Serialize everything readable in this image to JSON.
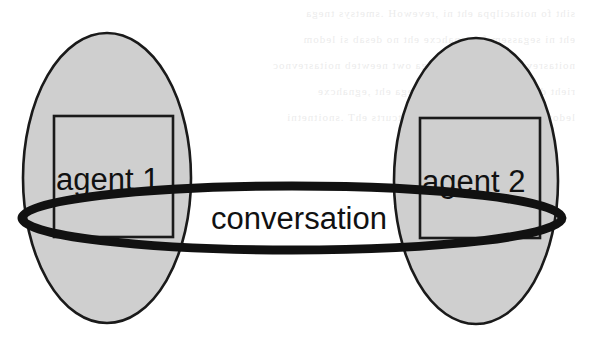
{
  "figure": {
    "kind": "venn-style agent conversation diagram",
    "background_color": "#ffffff",
    "ink_color": "#111111",
    "agent_fill_color": "#cfcfcf",
    "nodes": [
      {
        "id": "agent-1",
        "label": "agent 1",
        "shape": "ellipse",
        "inner_shape": "square",
        "cx": 107,
        "cy": 178,
        "rx": 84,
        "ry": 145,
        "square": {
          "x": 54,
          "y": 116,
          "w": 119,
          "h": 121
        },
        "label_x": 56,
        "label_y": 190
      },
      {
        "id": "agent-2",
        "label": "agent 2",
        "shape": "ellipse",
        "inner_shape": "square",
        "cx": 476,
        "cy": 181,
        "rx": 82,
        "ry": 143,
        "square": {
          "x": 420,
          "y": 118,
          "w": 120,
          "h": 120
        },
        "label_x": 422,
        "label_y": 192
      }
    ],
    "link": {
      "id": "conversation",
      "label": "conversation",
      "shape": "ellipse",
      "cx": 292,
      "cy": 218,
      "rx": 270,
      "ry": 32,
      "stroke_width": 9,
      "label_x": 299,
      "label_y": 229
    },
    "page_bleed_lines": [
      "siht fo noitacilppa eht ni ,revewoH .smetsys tnega",
      "eht ni segassem fo egnahcxe eht no desab si ledom",
      "noitasrevnoc a gniruD .stnega owt neewteb noitasrevnoc",
      "rieht dna snoitca etaitogen stnega eht ,egnahcxe",
      "ledom lanoitasrevnoc siht fo erutcurts ehT .snoitnetni"
    ]
  }
}
